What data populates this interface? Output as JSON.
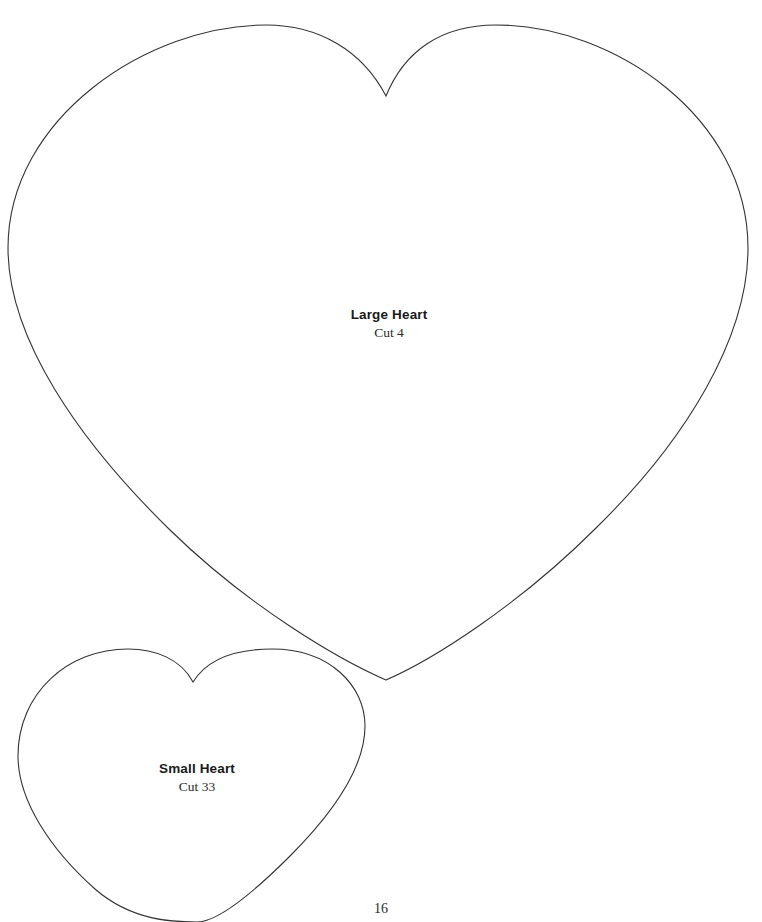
{
  "page": {
    "number": "16",
    "background_color": "#ffffff",
    "width": 762,
    "height": 922
  },
  "stroke": {
    "color": "#333333",
    "width": 1.1
  },
  "patterns": [
    {
      "id": "large-heart",
      "title": "Large Heart",
      "cut_instruction": "Cut 4",
      "label_x": 389,
      "label_y": 308,
      "outline_path": "M 386 96 C 362 50 318 25 266 25 C 148 25 8 118 8 248 C 8 338 78 440 170 530 C 250 608 340 660 386 680 C 432 660 518 606 596 528 C 686 440 748 338 748 248 C 748 118 614 25 496 25 C 440 25 404 52 386 96 Z"
    },
    {
      "id": "small-heart",
      "title": "Small Heart",
      "cut_instruction": "Cut 33",
      "label_x": 197,
      "label_y": 762,
      "outline_path": "M 193 682 C 181 659 155 649 128 649 C 68 649 18 693 18 756 C 18 800 50 849 95 889 C 133 922 176 922 197 922 C 218 922 252 894 290 856 C 334 812 365 768 365 726 C 365 686 330 649 272 649 C 232 649 206 661 193 682 Z"
    }
  ],
  "icons": {
    "heart_outline": "heart-outline-icon"
  }
}
